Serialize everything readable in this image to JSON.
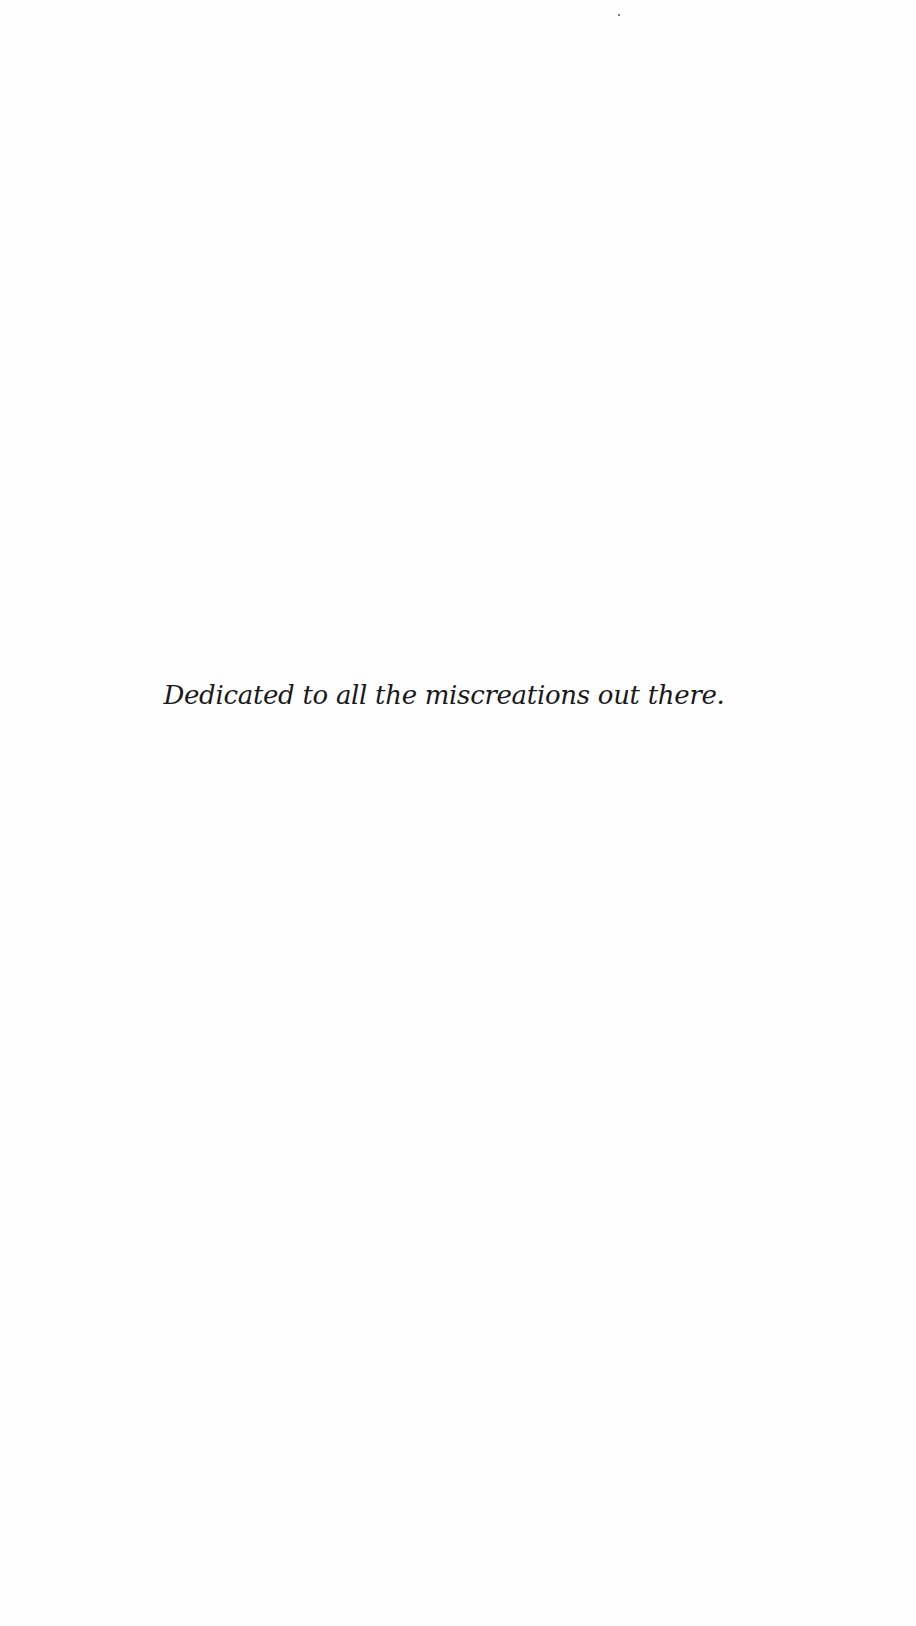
{
  "page": {
    "type": "dedication",
    "dedication_text": "Dedicated to all the miscreations out there."
  }
}
